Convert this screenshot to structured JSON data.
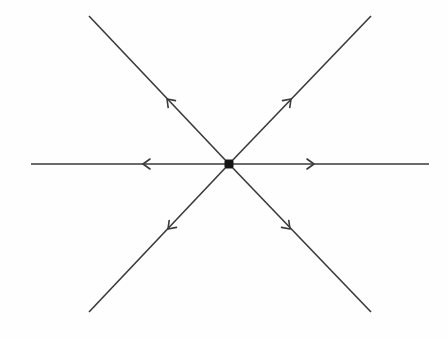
{
  "diagram": {
    "type": "phase-portrait",
    "colors": {
      "background": "#fefefe",
      "line": "#3a3a3a",
      "node": "#151515"
    },
    "center": {
      "x": 229,
      "y": 164,
      "size": 9
    },
    "trajectories": [
      {
        "id": "horizontal-left",
        "from": [
          229,
          164
        ],
        "to": [
          31,
          164
        ],
        "arrow_tip": [
          143,
          164
        ],
        "direction": "outward"
      },
      {
        "id": "horizontal-right",
        "from": [
          229,
          164
        ],
        "to": [
          429,
          164
        ],
        "arrow_tip": [
          314,
          164
        ],
        "direction": "outward"
      },
      {
        "id": "upper-left",
        "from": [
          229,
          164
        ],
        "to": [
          89,
          16
        ],
        "arrow_tip": [
          167,
          99
        ],
        "direction": "outward"
      },
      {
        "id": "upper-right",
        "from": [
          229,
          164
        ],
        "to": [
          371,
          16
        ],
        "arrow_tip": [
          291,
          99
        ],
        "direction": "outward"
      },
      {
        "id": "lower-left",
        "from": [
          229,
          164
        ],
        "to": [
          89,
          312
        ],
        "arrow_tip": [
          168,
          229
        ],
        "direction": "outward"
      },
      {
        "id": "lower-right",
        "from": [
          229,
          164
        ],
        "to": [
          371,
          312
        ],
        "arrow_tip": [
          290,
          229
        ],
        "direction": "outward"
      }
    ]
  }
}
